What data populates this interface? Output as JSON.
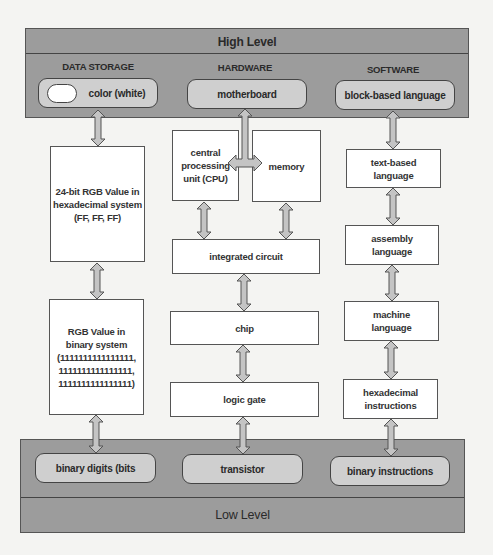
{
  "diagram": {
    "top_band": {
      "label": "High Level"
    },
    "bottom_band": {
      "label": "Low Level"
    },
    "colors": {
      "band_fill": "#9c9c9c",
      "pill_fill": "#cfcfcf",
      "box_fill": "#ffffff",
      "arrow_fill": "#c4c4c4",
      "stroke": "#555555"
    },
    "columns": [
      {
        "header": "DATA STORAGE",
        "top_item": "color (white)",
        "nodes": [
          "24-bit RGB Value in\nhexadecimal system\n(FF, FF, FF)",
          "RGB Value in\nbinary system\n(1111111111111111,\n1111111111111111,\n1111111111111111)"
        ],
        "bottom_item": "binary digits (bits"
      },
      {
        "header": "HARDWARE",
        "top_item": "motherboard",
        "nodes": [
          "central\nprocessing\nunit (CPU)",
          "memory",
          "integrated circuit",
          "chip",
          "logic gate"
        ],
        "bottom_item": "transistor"
      },
      {
        "header": "SOFTWARE",
        "top_item": "block-based language",
        "nodes": [
          "text-based\nlanguage",
          "assembly\nlanguage",
          "machine\nlanguage",
          "hexadecimal\ninstructions"
        ],
        "bottom_item": "binary instructions"
      }
    ],
    "edges": [
      [
        "color (white)",
        "24-bit RGB Value"
      ],
      [
        "24-bit RGB Value",
        "RGB Value in binary"
      ],
      [
        "RGB Value in binary",
        "binary digits (bits"
      ],
      [
        "motherboard",
        "central processing unit (CPU)"
      ],
      [
        "motherboard",
        "memory"
      ],
      [
        "central processing unit (CPU)",
        "integrated circuit"
      ],
      [
        "memory",
        "integrated circuit"
      ],
      [
        "integrated circuit",
        "chip"
      ],
      [
        "chip",
        "logic gate"
      ],
      [
        "logic gate",
        "transistor"
      ],
      [
        "block-based language",
        "text-based language"
      ],
      [
        "text-based language",
        "assembly language"
      ],
      [
        "assembly language",
        "machine language"
      ],
      [
        "machine language",
        "hexadecimal instructions"
      ],
      [
        "hexadecimal instructions",
        "binary instructions"
      ]
    ]
  }
}
